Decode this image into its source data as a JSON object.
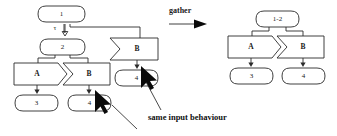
{
  "figure": {
    "operator_label": "gather",
    "caption": "same input behaviour",
    "tau_label": "τ",
    "stroke_color": "#2b2b2b",
    "background_color": "#ffffff",
    "pointer_color": "#0a0a0a"
  },
  "left_graph": {
    "states": [
      {
        "id": "l-state-1",
        "label": "1"
      },
      {
        "id": "l-state-2",
        "label": "2"
      },
      {
        "id": "l-state-3",
        "label": "3"
      },
      {
        "id": "l-state-4a",
        "label": "4"
      },
      {
        "id": "l-state-4b",
        "label": "4"
      }
    ],
    "actions": [
      {
        "id": "l-action-b-top",
        "label": "B",
        "shape": "chevron"
      },
      {
        "id": "l-action-a",
        "label": "A",
        "shape": "pentagon"
      },
      {
        "id": "l-action-b-bottom",
        "label": "B",
        "shape": "chevron"
      }
    ]
  },
  "right_graph": {
    "states": [
      {
        "id": "r-state-12",
        "label": "1-2"
      },
      {
        "id": "r-state-3",
        "label": "3"
      },
      {
        "id": "r-state-4",
        "label": "4"
      }
    ],
    "actions": [
      {
        "id": "r-action-a",
        "label": "A",
        "shape": "pentagon"
      },
      {
        "id": "r-action-b",
        "label": "B",
        "shape": "chevron"
      }
    ]
  },
  "annotations": {
    "pointer_upper_target": "4",
    "pointer_lower_target": "4",
    "caption_text": "same input behaviour"
  }
}
